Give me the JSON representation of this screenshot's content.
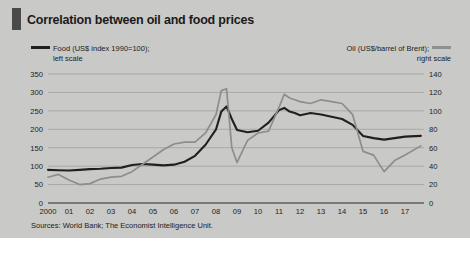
{
  "figure": {
    "title": "Correlation between oil and food prices",
    "source": "Sources: World Bank; The Economist Intelligence Unit.",
    "accent_color": "#4a4a4a",
    "background_color": "#c9c9c7"
  },
  "legend": {
    "left": {
      "line1": "Food (US$ index 1990=100);",
      "line2": "left scale",
      "color": "#231f1f"
    },
    "right": {
      "line1": "Oil (US$/barrel of Brent);",
      "line2": "right scale",
      "color": "#8f8f8d"
    }
  },
  "chart_data": {
    "type": "line",
    "title": "Correlation between oil and food prices",
    "subtitle": "",
    "xlabel": "",
    "ylabel": "",
    "grid": true,
    "legend_position": "top",
    "x": [
      2000,
      2000.5,
      2001,
      2001.5,
      2002,
      2002.5,
      2003,
      2003.5,
      2004,
      2004.5,
      2005,
      2005.5,
      2006,
      2006.5,
      2007,
      2007.5,
      2008,
      2008.25,
      2008.5,
      2008.75,
      2009,
      2009.5,
      2010,
      2010.5,
      2011,
      2011.25,
      2011.5,
      2011.75,
      2012,
      2012.5,
      2013,
      2013.5,
      2014,
      2014.5,
      2015,
      2015.5,
      2016,
      2016.5,
      2017,
      2017.75
    ],
    "x_tick_labels": [
      "2000",
      "01",
      "02",
      "03",
      "04",
      "05",
      "06",
      "07",
      "08",
      "09",
      "10",
      "11",
      "12",
      "13",
      "14",
      "15",
      "16",
      "17"
    ],
    "x_tick_values": [
      2000,
      2001,
      2002,
      2003,
      2004,
      2005,
      2006,
      2007,
      2008,
      2009,
      2010,
      2011,
      2012,
      2013,
      2014,
      2015,
      2016,
      2017
    ],
    "xlim": [
      2000,
      2017.9
    ],
    "axes": [
      {
        "id": "left",
        "side": "left",
        "label": "Food (US$ index 1990=100)",
        "ylim": [
          0,
          350
        ],
        "ticks": [
          0,
          50,
          100,
          150,
          200,
          250,
          300,
          350
        ]
      },
      {
        "id": "right",
        "side": "right",
        "label": "Oil (US$/barrel of Brent)",
        "ylim": [
          0,
          140
        ],
        "ticks": [
          0,
          20,
          40,
          60,
          80,
          100,
          120,
          140
        ]
      }
    ],
    "series": [
      {
        "name": "Food (US$ index 1990=100)",
        "axis": "left",
        "color": "#231f1f",
        "values": [
          90,
          89,
          88,
          90,
          92,
          93,
          95,
          96,
          103,
          106,
          104,
          102,
          104,
          112,
          128,
          158,
          200,
          248,
          262,
          228,
          198,
          192,
          196,
          218,
          252,
          258,
          248,
          244,
          238,
          244,
          240,
          234,
          228,
          212,
          182,
          176,
          172,
          176,
          180,
          182
        ]
      },
      {
        "name": "Oil (US$/barrel of Brent)",
        "axis": "right",
        "color": "#8d8d8b",
        "values": [
          28,
          31,
          25,
          20,
          21,
          26,
          28,
          29,
          34,
          42,
          50,
          58,
          64,
          66,
          66,
          76,
          96,
          122,
          124,
          60,
          44,
          68,
          76,
          78,
          104,
          118,
          114,
          112,
          110,
          108,
          112,
          110,
          108,
          96,
          56,
          52,
          34,
          46,
          52,
          62
        ]
      }
    ],
    "annotations": [
      {
        "text": "2008 price spike",
        "x": 2008.4
      },
      {
        "text": "2014-16 collapse",
        "x": 2015.2
      }
    ]
  }
}
